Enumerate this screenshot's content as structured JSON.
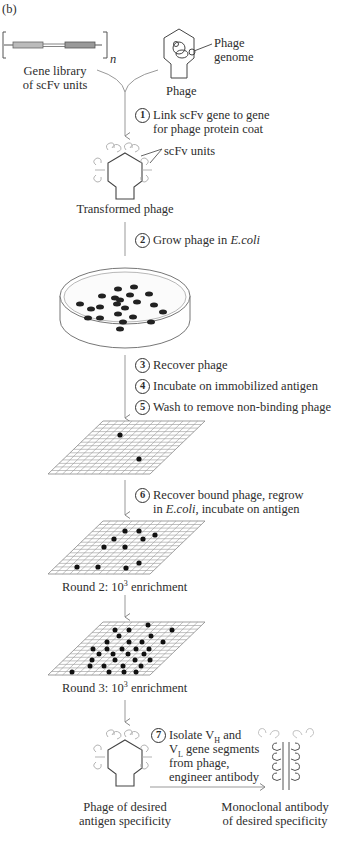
{
  "figure": {
    "panel_label": "(b)",
    "inputs": {
      "gene_library": {
        "line1": "Gene library",
        "line2": "of scFv units",
        "repeat_symbol": "n"
      },
      "phage": {
        "label": "Phage",
        "genome_label_line1": "Phage",
        "genome_label_line2": "genome"
      }
    },
    "steps": [
      {
        "number": "1",
        "line1": "Link scFv gene to gene",
        "line2": "for phage protein coat"
      },
      {
        "number": "2",
        "text_prefix": "Grow phage in ",
        "text_italic": "E.coli"
      },
      {
        "number": "3",
        "text": "Recover phage"
      },
      {
        "number": "4",
        "text": "Incubate on immobilized antigen"
      },
      {
        "number": "5",
        "text": "Wash to remove non-binding phage"
      },
      {
        "number": "6",
        "line1": "Recover bound phage, regrow",
        "line2_prefix": "in ",
        "line2_italic": "E.coli",
        "line2_suffix": ", incubate on antigen"
      },
      {
        "number": "7",
        "line1_prefix": "Isolate V",
        "line1_sub": "H",
        "line1_suffix": " and",
        "line2_prefix": "V",
        "line2_sub": "L",
        "line2_suffix": " gene segments",
        "line3": "from phage,",
        "line4": "engineer antibody"
      }
    ],
    "labels": {
      "scfv_units": "scFv units",
      "transformed_phage": "Transformed phage",
      "round2_prefix": "Round 2: 10",
      "round2_exp": "3",
      "round2_suffix": " enrichment",
      "round3_prefix": "Round 3: 10",
      "round3_exp": "3",
      "round3_suffix": " enrichment",
      "phage_desired_line1": "Phage of desired",
      "phage_desired_line2": "antigen specificity",
      "antibody_line1": "Monoclonal antibody",
      "antibody_line2": "of desired specificity"
    },
    "colonies": {
      "petri_dish_count": 24,
      "grid1_count": 2,
      "grid2_count": 11,
      "grid3_count": 29
    }
  }
}
